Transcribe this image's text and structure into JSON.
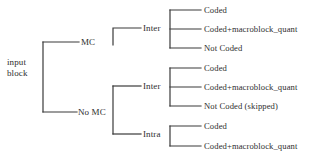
{
  "diagram": {
    "type": "tree",
    "title": "",
    "style": {
      "line_color": "#3a3a3a",
      "text_color": "#2e2e2e",
      "background": "#ffffff",
      "line_width": 1.2
    },
    "root": {
      "id": "root",
      "label_line1": "input",
      "label_line2": "block"
    },
    "level1": [
      {
        "id": "mc",
        "label": "MC",
        "x": 81,
        "y": 42
      },
      {
        "id": "no-mc",
        "label": "No MC",
        "x": 78,
        "y": 112
      }
    ],
    "level2": [
      {
        "id": "mc-inter",
        "label": "Inter",
        "parent": "mc",
        "x": 143,
        "y": 28
      },
      {
        "id": "nomc-inter",
        "label": "Inter",
        "parent": "no-mc",
        "x": 143,
        "y": 86
      },
      {
        "id": "nomc-intra",
        "label": "Intra",
        "parent": "no-mc",
        "x": 143,
        "y": 134
      }
    ],
    "leaves": [
      {
        "id": "mc-inter-coded",
        "parent": "mc-inter",
        "label": "Coded",
        "x": 204,
        "y": 10
      },
      {
        "id": "mc-inter-coded-mq",
        "parent": "mc-inter",
        "label": "Coded+macroblock_quant",
        "x": 204,
        "y": 29
      },
      {
        "id": "mc-inter-notcoded",
        "parent": "mc-inter",
        "label": "Not Coded",
        "x": 204,
        "y": 48
      },
      {
        "id": "nomc-inter-coded",
        "parent": "nomc-inter",
        "label": "Coded",
        "x": 204,
        "y": 68
      },
      {
        "id": "nomc-inter-coded-mq",
        "parent": "nomc-inter",
        "label": "Coded+macroblock_quant",
        "x": 204,
        "y": 87
      },
      {
        "id": "nomc-inter-notcoded",
        "parent": "nomc-inter",
        "label": "Not Coded (skipped)",
        "x": 204,
        "y": 106
      },
      {
        "id": "nomc-intra-coded",
        "parent": "nomc-intra",
        "label": "Coded",
        "x": 204,
        "y": 126
      },
      {
        "id": "nomc-intra-coded-mq",
        "parent": "nomc-intra",
        "label": "Coded+macroblock_quant",
        "x": 204,
        "y": 146
      }
    ]
  }
}
